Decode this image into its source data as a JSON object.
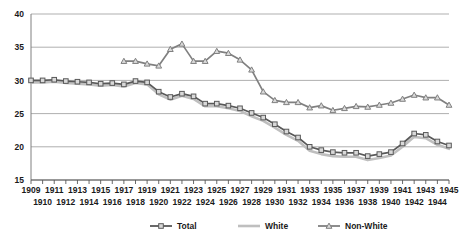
{
  "chart_data": {
    "type": "line",
    "title": "",
    "xlabel": "",
    "ylabel": "",
    "xlim": [
      1909,
      1945
    ],
    "ylim": [
      15,
      40
    ],
    "ytick_labels": [
      "40",
      "35",
      "30",
      "25",
      "20",
      "15"
    ],
    "yticks": [
      40,
      35,
      30,
      25,
      20,
      15
    ],
    "grid": true,
    "legend_position": "bottom",
    "x": [
      1909,
      1910,
      1911,
      1912,
      1913,
      1914,
      1915,
      1916,
      1917,
      1918,
      1919,
      1920,
      1921,
      1922,
      1923,
      1924,
      1925,
      1926,
      1927,
      1928,
      1929,
      1930,
      1931,
      1932,
      1933,
      1934,
      1935,
      1936,
      1937,
      1938,
      1939,
      1940,
      1941,
      1942,
      1943,
      1944,
      1945
    ],
    "xtick_labels": [
      "1909",
      "1910",
      "1911",
      "1912",
      "1913",
      "1914",
      "1915",
      "1916",
      "1917",
      "1918",
      "1919",
      "1920",
      "1921",
      "1922",
      "1923",
      "1924",
      "1925",
      "1926",
      "1927",
      "1928",
      "1929",
      "1930",
      "1931",
      "1932",
      "1933",
      "1934",
      "1935",
      "1936",
      "1937",
      "1938",
      "1939",
      "1940",
      "1941",
      "1942",
      "1943",
      "1944",
      "1945"
    ],
    "xtick_labels_shown": [
      "1909",
      "1911",
      "1913",
      "1915",
      "1917",
      "1919",
      "1921",
      "1923",
      "1925",
      "1927",
      "1929",
      "1931",
      "1933",
      "1935",
      "1937",
      "1939",
      "1941",
      "1943",
      "1945"
    ],
    "series": [
      {
        "name": "Total",
        "color": "#595959",
        "marker": "square",
        "values": [
          30.0,
          30.0,
          30.1,
          29.9,
          29.8,
          29.7,
          29.5,
          29.6,
          29.4,
          29.9,
          29.7,
          28.3,
          27.5,
          28.0,
          27.6,
          26.5,
          26.5,
          26.2,
          25.8,
          25.1,
          24.4,
          23.4,
          22.3,
          21.4,
          20.0,
          19.5,
          19.2,
          19.1,
          19.1,
          18.6,
          18.9,
          19.2,
          20.5,
          22.0,
          21.8,
          20.8,
          20.2
        ]
      },
      {
        "name": "White",
        "color": "#bfbfbf",
        "marker": "none",
        "values": [
          29.7,
          29.7,
          29.8,
          29.6,
          29.5,
          29.4,
          29.2,
          29.3,
          29.1,
          29.6,
          29.4,
          27.9,
          27.1,
          27.7,
          27.2,
          26.1,
          26.1,
          25.8,
          25.4,
          24.6,
          23.9,
          22.9,
          21.8,
          20.9,
          19.4,
          18.9,
          18.6,
          18.5,
          18.5,
          18.0,
          18.3,
          18.7,
          20.0,
          21.5,
          21.3,
          20.3,
          19.7
        ]
      },
      {
        "name": "Non-White",
        "color": "#808080",
        "marker": "triangle",
        "values": [
          null,
          null,
          null,
          null,
          null,
          null,
          null,
          null,
          32.9,
          32.9,
          32.5,
          32.2,
          34.7,
          35.5,
          32.9,
          32.9,
          34.4,
          34.1,
          33.1,
          31.6,
          28.3,
          27.0,
          26.7,
          26.7,
          25.9,
          26.2,
          25.5,
          25.8,
          26.1,
          26.0,
          26.3,
          26.6,
          27.2,
          27.8,
          27.4,
          27.4,
          26.3
        ]
      }
    ]
  },
  "legend": {
    "items": [
      {
        "label": "Total"
      },
      {
        "label": "White"
      },
      {
        "label": "Non-White"
      }
    ]
  },
  "colors": {
    "total": "#595959",
    "white": "#bfbfbf",
    "nonwhite": "#808080",
    "grid": "#a6a6a6",
    "axis": "#808080",
    "text": "#1a1a1a"
  }
}
